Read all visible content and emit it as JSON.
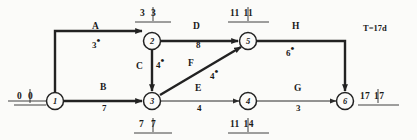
{
  "diagram": {
    "title_note": "T=17d",
    "nodes": [
      {
        "id": "1",
        "label": "1",
        "x": 55,
        "y": 101,
        "times": "0|0",
        "early": "0",
        "late": "0",
        "pos": "left"
      },
      {
        "id": "2",
        "label": "2",
        "x": 152,
        "y": 41,
        "times": "3|3",
        "early": "3",
        "late": "3",
        "pos": "above"
      },
      {
        "id": "3",
        "label": "3",
        "x": 152,
        "y": 101,
        "times": "7|7",
        "early": "7",
        "late": "7",
        "pos": "below"
      },
      {
        "id": "4",
        "label": "4",
        "x": 248,
        "y": 101,
        "times": "11|14",
        "early": "11",
        "late": "14",
        "pos": "below"
      },
      {
        "id": "5",
        "label": "5",
        "x": 248,
        "y": 41,
        "times": "11|11",
        "early": "11",
        "late": "11",
        "pos": "above"
      },
      {
        "id": "6",
        "label": "6",
        "x": 345,
        "y": 101,
        "times": "17|17",
        "early": "17",
        "late": "17",
        "pos": "right"
      }
    ],
    "activities": [
      {
        "key": "A",
        "name": "A",
        "duration": "3",
        "critical": true,
        "from": "1",
        "to": "2",
        "name_x": 95,
        "name_y": 27,
        "dur_x": 95,
        "dur_y": 44
      },
      {
        "key": "B",
        "name": "B",
        "duration": "7",
        "critical": true,
        "from": "1",
        "to": "3",
        "name_x": 103,
        "name_y": 88,
        "dur_x": 103,
        "dur_y": 108
      },
      {
        "key": "C",
        "name": "C",
        "duration": "4",
        "critical": true,
        "from": "2",
        "to": "3",
        "name_x": 140,
        "name_y": 67,
        "dur_x": 157,
        "dur_y": 65
      },
      {
        "key": "D",
        "name": "D",
        "duration": "8",
        "critical": true,
        "from": "2",
        "to": "5",
        "name_x": 196,
        "name_y": 27,
        "dur_x": 198,
        "dur_y": 45
      },
      {
        "key": "E",
        "name": "E",
        "duration": "4",
        "critical": false,
        "from": "3",
        "to": "4",
        "name_x": 198,
        "name_y": 89,
        "dur_x": 199,
        "dur_y": 108
      },
      {
        "key": "F",
        "name": "F",
        "duration": "4",
        "critical": true,
        "from": "3",
        "to": "5",
        "name_x": 191,
        "name_y": 64,
        "dur_x": 212,
        "dur_y": 75
      },
      {
        "key": "G",
        "name": "G",
        "duration": "3",
        "critical": false,
        "from": "4",
        "to": "6",
        "name_x": 297,
        "name_y": 89,
        "dur_x": 298,
        "dur_y": 108
      },
      {
        "key": "H",
        "name": "H",
        "duration": "6",
        "critical": true,
        "from": "5",
        "to": "6",
        "name_x": 295,
        "name_y": 27,
        "dur_x": 288,
        "dur_y": 52
      }
    ],
    "starred_durations": [
      "A",
      "C",
      "F",
      "H"
    ],
    "colors": {
      "line": "#2b2b2b",
      "critical": "#222222",
      "text": "#1a1a1a",
      "background": "#fbfbf9"
    }
  }
}
